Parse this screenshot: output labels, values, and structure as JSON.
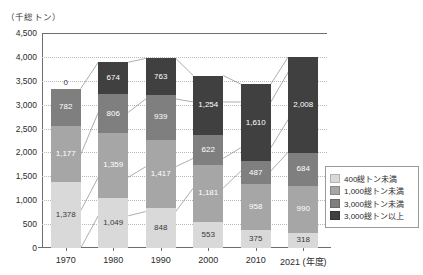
{
  "unit_label": "（千総トン）",
  "axis": {
    "x_title": "（年度）",
    "y_ticks": [
      "4,500",
      "4,000",
      "3,500",
      "3,000",
      "2,500",
      "2,000",
      "1,500",
      "1,000",
      "500",
      "0"
    ]
  },
  "legend": {
    "items": [
      {
        "label": "400総トン未満",
        "color": "#d9d9d9"
      },
      {
        "label": "1,000総トン未満",
        "color": "#a6a6a6"
      },
      {
        "label": "3,000総トン未満",
        "color": "#7f7f7f"
      },
      {
        "label": "3,000総トン以上",
        "color": "#404040"
      }
    ]
  },
  "chart_data": {
    "type": "bar",
    "title": "",
    "xlabel": "（年度）",
    "ylabel": "（千総トン）",
    "ylim": [
      0,
      4500
    ],
    "ytick_step": 500,
    "grid": true,
    "stacked": true,
    "legend_position": "right-bottom",
    "categories": [
      "1970",
      "1980",
      "1990",
      "2000",
      "2010",
      "2021"
    ],
    "category_labels": [
      "1970",
      "1980",
      "1990",
      "2000",
      "2010",
      "2021 (年度)"
    ],
    "series": [
      {
        "name": "400総トン未満",
        "color": "#d9d9d9",
        "values": [
          1378,
          1049,
          848,
          553,
          375,
          318
        ],
        "labels": [
          "1,378",
          "1,049",
          "848",
          "553",
          "375",
          "318"
        ]
      },
      {
        "name": "1,000総トン未満",
        "color": "#a6a6a6",
        "values": [
          1177,
          1359,
          1417,
          1181,
          958,
          990
        ],
        "labels": [
          "1,177",
          "1,359",
          "1,417",
          "1,181",
          "958",
          "990"
        ]
      },
      {
        "name": "3,000総トン未満",
        "color": "#7f7f7f",
        "values": [
          782,
          806,
          939,
          622,
          487,
          684
        ],
        "labels": [
          "782",
          "806",
          "939",
          "622",
          "487",
          "684"
        ]
      },
      {
        "name": "3,000総トン以上",
        "color": "#404040",
        "values": [
          0,
          674,
          763,
          1254,
          1610,
          2008
        ],
        "labels": [
          "0",
          "674",
          "763",
          "1,254",
          "1,610",
          "2,008"
        ]
      }
    ],
    "totals": [
      3337,
      3888,
      3967,
      3610,
      3430,
      4000
    ]
  }
}
